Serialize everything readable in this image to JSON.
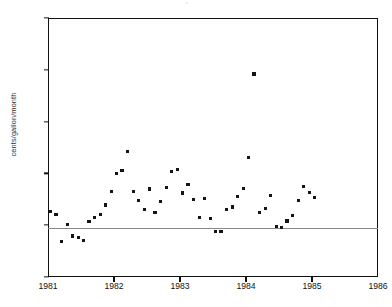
{
  "figure": {
    "top_artifact_text": "▫",
    "background_color": "#ffffff",
    "marker_color": "#141414",
    "axis_color": "#111111",
    "zero_line_color": "#8a8a8a"
  },
  "chart_data": {
    "type": "scatter",
    "title": "",
    "xlabel": "",
    "ylabel": "cents/gallon/month",
    "xlim": [
      1981,
      1986
    ],
    "ylim": [
      -1,
      4
    ],
    "xticks": [
      1981,
      1982,
      1983,
      1984,
      1985,
      1986
    ],
    "xtick_labels": [
      "1981",
      "1982",
      "1983",
      "1984",
      "1985",
      "1986"
    ],
    "yticks": [
      -1,
      0,
      1,
      2,
      3,
      4
    ],
    "ytick_labels": [
      "-1",
      "0",
      "1",
      "2",
      "3",
      "4"
    ],
    "grid": false,
    "legend": null,
    "reference_lines": [
      {
        "axis": "y",
        "value": 0
      }
    ],
    "series": [
      {
        "name": "monthly change",
        "marker": "square",
        "points": [
          {
            "x": 1981.04,
            "y": 0.26
          },
          {
            "x": 1981.12,
            "y": 0.21
          },
          {
            "x": 1981.21,
            "y": -0.32
          },
          {
            "x": 1981.29,
            "y": 0.01
          },
          {
            "x": 1981.37,
            "y": -0.21
          },
          {
            "x": 1981.46,
            "y": -0.23
          },
          {
            "x": 1981.54,
            "y": -0.3
          },
          {
            "x": 1981.62,
            "y": 0.07
          },
          {
            "x": 1981.71,
            "y": 0.15
          },
          {
            "x": 1981.79,
            "y": 0.21
          },
          {
            "x": 1981.87,
            "y": 0.39
          },
          {
            "x": 1981.96,
            "y": 0.65
          },
          {
            "x": 1982.04,
            "y": 1.0
          },
          {
            "x": 1982.12,
            "y": 1.06
          },
          {
            "x": 1982.21,
            "y": 1.42
          },
          {
            "x": 1982.29,
            "y": 0.65
          },
          {
            "x": 1982.37,
            "y": 0.47
          },
          {
            "x": 1982.46,
            "y": 0.31
          },
          {
            "x": 1982.54,
            "y": 0.7
          },
          {
            "x": 1982.62,
            "y": 0.24
          },
          {
            "x": 1982.71,
            "y": 0.46
          },
          {
            "x": 1982.79,
            "y": 0.72
          },
          {
            "x": 1982.87,
            "y": 1.03
          },
          {
            "x": 1982.96,
            "y": 1.08
          },
          {
            "x": 1983.04,
            "y": 0.62
          },
          {
            "x": 1983.12,
            "y": 0.78
          },
          {
            "x": 1983.21,
            "y": 0.5
          },
          {
            "x": 1983.29,
            "y": 0.15
          },
          {
            "x": 1983.37,
            "y": 0.52
          },
          {
            "x": 1983.46,
            "y": 0.13
          },
          {
            "x": 1983.54,
            "y": -0.12
          },
          {
            "x": 1983.62,
            "y": -0.12
          },
          {
            "x": 1983.71,
            "y": 0.3
          },
          {
            "x": 1983.79,
            "y": 0.35
          },
          {
            "x": 1983.87,
            "y": 0.55
          },
          {
            "x": 1983.96,
            "y": 0.71
          },
          {
            "x": 1984.04,
            "y": 1.31
          },
          {
            "x": 1984.12,
            "y": 2.92
          },
          {
            "x": 1984.21,
            "y": 0.24
          },
          {
            "x": 1984.29,
            "y": 0.33
          },
          {
            "x": 1984.37,
            "y": 0.58
          },
          {
            "x": 1984.46,
            "y": -0.03
          },
          {
            "x": 1984.54,
            "y": -0.05
          },
          {
            "x": 1984.62,
            "y": 0.08
          },
          {
            "x": 1984.71,
            "y": 0.19
          },
          {
            "x": 1984.79,
            "y": 0.48
          },
          {
            "x": 1984.87,
            "y": 0.74
          },
          {
            "x": 1984.96,
            "y": 0.63
          },
          {
            "x": 1985.04,
            "y": 0.53
          }
        ]
      }
    ]
  }
}
